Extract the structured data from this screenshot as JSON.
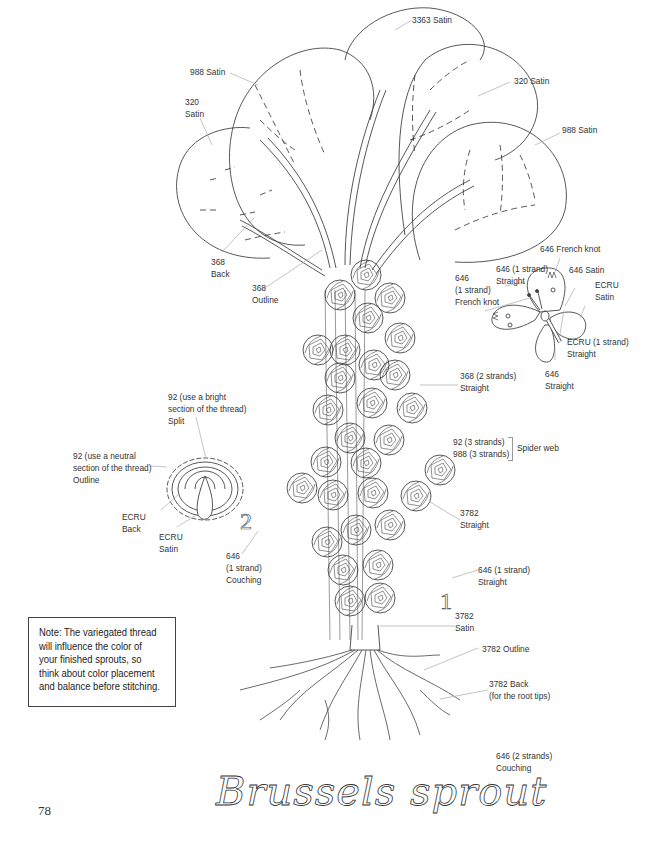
{
  "page": {
    "title": "Brussels sprout",
    "page_number": "78",
    "step_numbers": [
      "1",
      "2"
    ]
  },
  "note": {
    "lines": [
      "Note: The variegated thread",
      "will influence the color of",
      "your finished sprouts, so",
      "think about color placement",
      "and balance before stitching."
    ]
  },
  "labels": {
    "leaf_3363": "3363 Satin",
    "leaf_988_top": "988 Satin",
    "leaf_320_left": "320\nSatin",
    "leaf_320_right": "320 Satin",
    "leaf_988_right": "988 Satin",
    "vein_368_back": "368\nBack",
    "stem_368_outline": "368\nOutline",
    "butterfly_french_knot_top": "646 French knot",
    "butterfly_antenna": "646 (1 strand)\nStraight",
    "butterfly_646_satin": "646 Satin",
    "butterfly_french_knot_left": "646\n(1 strand)\nFrench knot",
    "butterfly_ecru_satin": "ECRU\nSatin",
    "butterfly_ecru_straight": "ECRU (1 strand)\nStraight",
    "butterfly_646_straight": "646\nStraight",
    "stalk_368_straight": "368 (2 strands)\nStraight",
    "spider_web_threads": "92 (3 strands)\n988 (3 strands)",
    "spider_web_stitch": "Spider web",
    "sprout_3782_straight": "3782\nStraight",
    "candle_split": "92 (use a bright\nsection of the thread)\nSplit",
    "candle_outline": "92 (use a neutral\nsection of the thread)\nOutline",
    "candle_ecru_back": "ECRU\nBack",
    "candle_ecru_satin": "ECRU\nSatin",
    "couching_646_1": "646\n(1 strand)\nCouching",
    "stitch_646_straight": "646 (1 strand)\nStraight",
    "base_3782_satin": "3782\nSatin",
    "root_3782_outline": "3782 Outline",
    "root_3782_back": "3782 Back\n(for the root tips)",
    "title_couching": "646 (2 strands)\nCouching"
  }
}
